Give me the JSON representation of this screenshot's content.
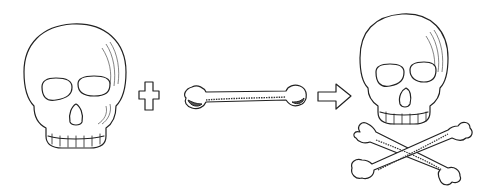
{
  "illustration": {
    "description": "Skull plus bone equals skull and crossbones",
    "elements": [
      {
        "name": "skull",
        "label": "skull"
      },
      {
        "name": "plus-sign",
        "label": "+"
      },
      {
        "name": "bone",
        "label": "bone"
      },
      {
        "name": "arrow",
        "label": "⇒"
      },
      {
        "name": "skull-and-crossbones",
        "label": "skull and crossbones"
      }
    ],
    "colors": {
      "background": "#ffffff",
      "ink": "#222222",
      "shade": "#555555"
    }
  }
}
